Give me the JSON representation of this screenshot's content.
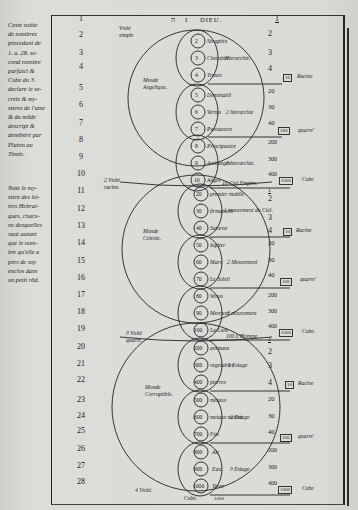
{
  "margin_notes": [
    {
      "id": "note-top",
      "lines": [
        "Ceste suitte",
        "de nombres",
        "procedant de",
        "1. a. 28. se-",
        "cond nombre",
        "parfaict &",
        "Cube du 3.",
        "declare le se-",
        "crets & my-",
        "steres de l'ame",
        "& du mōde",
        "descript &",
        "demōstré par",
        "Platon au",
        "Timée."
      ]
    },
    {
      "id": "note-bottom",
      "lines": [
        "Note le my-",
        "stere des let-",
        "tres Hebrai-",
        "ques, chacu-",
        "ne desquelles",
        "vaut autant",
        "que le nom-",
        "bre qu'elle a",
        "pres de soy",
        "enclos dans",
        "un petit rōd."
      ]
    }
  ],
  "header": {
    "hebrew": "ה",
    "yod": "I",
    "title": "DIEU.",
    "right_number": "1"
  },
  "left_numbers": [
    "1",
    "2",
    "3",
    "4",
    "5",
    "6",
    "7",
    "8",
    "9",
    "10",
    "11",
    "12",
    "13",
    "14",
    "15",
    "16",
    "17",
    "18",
    "19",
    "20",
    "21",
    "22",
    "23",
    "24",
    "25",
    "26",
    "27",
    "28"
  ],
  "unity_labels": [
    {
      "id": "unite-simple",
      "lines": [
        "Vnité",
        "simple"
      ]
    },
    {
      "id": "unite-racine",
      "lines": [
        "2 Vnité",
        "racine."
      ]
    },
    {
      "id": "unite-quarre",
      "lines": [
        "3 Vnité",
        "quarre."
      ]
    },
    {
      "id": "unite-cube",
      "lines": [
        "4 Vnité."
      ]
    }
  ],
  "worlds": [
    {
      "id": "angelique",
      "name": [
        "Monde",
        "Angelique."
      ]
    },
    {
      "id": "celeste",
      "name": [
        "Monde",
        "Celeste."
      ]
    },
    {
      "id": "corruptible",
      "name": [
        "Monde",
        "Corruptible."
      ]
    }
  ],
  "hierarchies": [
    {
      "orders": [
        {
          "n": "2",
          "name": "Seraphin"
        },
        {
          "n": "3",
          "name": "Cherubin"
        },
        {
          "n": "4",
          "name": "Trones"
        }
      ],
      "label": "Hierarchie."
    },
    {
      "orders": [
        {
          "n": "5",
          "name": "Dominatiō"
        },
        {
          "n": "6",
          "name": "Vertus"
        },
        {
          "n": "7",
          "name": "Puissances"
        }
      ],
      "label": "2 hierarchie"
    },
    {
      "orders": [
        {
          "n": "8",
          "name": "Principautez"
        },
        {
          "n": "9",
          "name": "Archanges"
        },
        {
          "n": "10",
          "name": "Anges"
        }
      ],
      "label": "3 hierarchie."
    },
    {
      "orders": [
        {
          "n": "20",
          "name": "premier mobile"
        },
        {
          "n": "30",
          "name": "firmament"
        },
        {
          "n": "40",
          "name": "Saturne"
        }
      ],
      "label": "1 mouvement du Ciel."
    },
    {
      "orders": [
        {
          "n": "50",
          "name": "Iupiter"
        },
        {
          "n": "60",
          "name": "Mars"
        },
        {
          "n": "70",
          "name": "Le Soleil"
        }
      ],
      "label": "2 Mouvement"
    },
    {
      "orders": [
        {
          "n": "80",
          "name": "Venus"
        },
        {
          "n": "90",
          "name": "Mercure"
        },
        {
          "n": "100",
          "name": "La Lune"
        }
      ],
      "label": "3 mouvement"
    },
    {
      "orders": [
        {
          "n": "200",
          "name": "animaux"
        },
        {
          "n": "300",
          "name": "vegetables"
        },
        {
          "n": "400",
          "name": "pierres"
        }
      ],
      "label": "1 Estage"
    },
    {
      "orders": [
        {
          "n": "500",
          "name": "metaux"
        },
        {
          "n": "600",
          "name": "metaux meslez"
        },
        {
          "n": "700",
          "name": "Feu"
        }
      ],
      "label": "2 Estage"
    },
    {
      "orders": [
        {
          "n": "800",
          "name": "Air"
        },
        {
          "n": "900",
          "name": "Eau"
        },
        {
          "n": "1000",
          "name": "Terre"
        }
      ],
      "label": "3 Estage"
    }
  ],
  "spans": [
    {
      "id": "ciel-empire",
      "text": "10 Ciel Empire.",
      "value": "1"
    },
    {
      "id": "homme",
      "text": "100 L'Homme",
      "value": "1"
    },
    {
      "id": "cube-bottom",
      "text": "Cube.",
      "value": "1000"
    }
  ],
  "right_column": {
    "block1": [
      "1",
      "2",
      "3",
      "4"
    ],
    "block1_box": {
      "value": "10",
      "label": "Racine"
    },
    "block2": [
      "20",
      "30",
      "40"
    ],
    "block2_box": {
      "value": "100",
      "label": "quarre'"
    },
    "block3": [
      "200",
      "300",
      "400"
    ],
    "block3_box": {
      "value": "1000",
      "label": "Cube"
    },
    "block4": [
      "1",
      "2",
      "3",
      "4"
    ],
    "block4_box": {
      "value": "10",
      "label": "Racine"
    },
    "block5": [
      "20",
      "30",
      "40"
    ],
    "block5_box": {
      "value": "100",
      "label": "quarre'"
    },
    "block6": [
      "200",
      "300",
      "400"
    ],
    "block6_box": {
      "value": "1000",
      "label": "Cube."
    },
    "block7": [
      "1",
      "2",
      "3",
      "4"
    ],
    "block7_box": {
      "value": "10",
      "label": "Racine"
    },
    "block8": [
      "20",
      "30",
      "40"
    ],
    "block8_box": {
      "value": "100",
      "label": "quarre'"
    },
    "block9": [
      "200",
      "300",
      "400"
    ],
    "block9_box": {
      "value": "1000",
      "label": "Cube"
    }
  }
}
